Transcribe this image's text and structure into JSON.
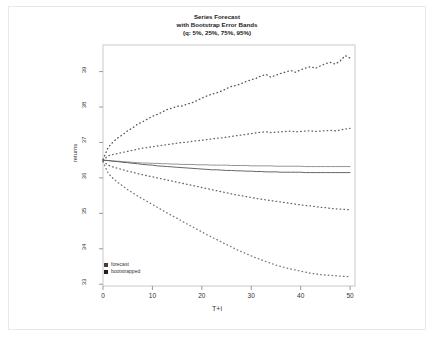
{
  "title": {
    "line1": "Series Forecast",
    "line2": "with Bootstrap Error Bands",
    "line3": "(q: 5%, 25%, 75%, 95%)"
  },
  "legend": {
    "items": [
      {
        "label": "forecast",
        "color": "#404040"
      },
      {
        "label": "bootstrapped",
        "color": "#202020"
      }
    ]
  },
  "chart_data": {
    "type": "line",
    "title": "Series Forecast with Bootstrap Error Bands (q: 5%, 25%, 75%, 95%)",
    "xlabel": "T+i",
    "ylabel": "returns",
    "xlim": [
      0,
      51
    ],
    "ylim": [
      32.95,
      39.75
    ],
    "xticks": [
      0,
      10,
      20,
      30,
      40,
      50
    ],
    "yticks": [
      33,
      34,
      35,
      36,
      37,
      38,
      39
    ],
    "grid": false,
    "legend_position": "bottom-left",
    "x": [
      0,
      1,
      2,
      3,
      4,
      5,
      6,
      7,
      8,
      9,
      10,
      11,
      12,
      13,
      14,
      15,
      16,
      17,
      18,
      19,
      20,
      21,
      22,
      23,
      24,
      25,
      26,
      27,
      28,
      29,
      30,
      31,
      32,
      33,
      34,
      35,
      36,
      37,
      38,
      39,
      40,
      41,
      42,
      43,
      44,
      45,
      46,
      47,
      48,
      49,
      50
    ],
    "series": [
      {
        "name": "q95",
        "style": "dotted",
        "color": "#555555",
        "values": [
          36.52,
          36.85,
          37.01,
          37.13,
          37.22,
          37.33,
          37.41,
          37.52,
          37.58,
          37.66,
          37.74,
          37.79,
          37.86,
          37.93,
          37.97,
          38.02,
          38.03,
          38.08,
          38.12,
          38.18,
          38.25,
          38.31,
          38.36,
          38.4,
          38.45,
          38.52,
          38.58,
          38.61,
          38.66,
          38.72,
          38.77,
          38.81,
          38.88,
          38.92,
          38.84,
          38.9,
          38.95,
          38.99,
          39.03,
          38.98,
          39.05,
          39.1,
          39.14,
          39.09,
          39.16,
          39.22,
          39.26,
          39.21,
          39.3,
          39.45,
          39.38
        ]
      },
      {
        "name": "q75",
        "style": "dotted",
        "color": "#666666",
        "values": [
          36.5,
          36.62,
          36.66,
          36.69,
          36.72,
          36.75,
          36.78,
          36.81,
          36.84,
          36.86,
          36.88,
          36.9,
          36.92,
          36.94,
          36.96,
          36.98,
          37.0,
          37.01,
          37.03,
          37.05,
          37.06,
          37.08,
          37.1,
          37.12,
          37.13,
          37.15,
          37.17,
          37.19,
          37.21,
          37.23,
          37.25,
          37.27,
          37.29,
          37.3,
          37.28,
          37.29,
          37.3,
          37.31,
          37.32,
          37.3,
          37.31,
          37.32,
          37.33,
          37.31,
          37.32,
          37.33,
          37.34,
          37.33,
          37.35,
          37.38,
          37.4
        ]
      },
      {
        "name": "forecast",
        "style": "solid",
        "color": "#888888",
        "values": [
          36.5,
          36.49,
          36.48,
          36.47,
          36.46,
          36.45,
          36.44,
          36.43,
          36.42,
          36.42,
          36.41,
          36.41,
          36.4,
          36.4,
          36.39,
          36.39,
          36.38,
          36.38,
          36.38,
          36.37,
          36.37,
          36.37,
          36.36,
          36.36,
          36.36,
          36.36,
          36.35,
          36.35,
          36.35,
          36.35,
          36.34,
          36.34,
          36.34,
          36.34,
          36.34,
          36.33,
          36.33,
          36.33,
          36.33,
          36.33,
          36.33,
          36.32,
          36.32,
          36.32,
          36.32,
          36.32,
          36.32,
          36.32,
          36.32,
          36.32,
          36.32
        ]
      },
      {
        "name": "bootstrapped",
        "style": "solid",
        "color": "#555555",
        "values": [
          36.5,
          36.49,
          36.47,
          36.46,
          36.44,
          36.43,
          36.41,
          36.4,
          36.38,
          36.37,
          36.36,
          36.34,
          36.33,
          36.32,
          36.31,
          36.3,
          36.29,
          36.28,
          36.27,
          36.26,
          36.25,
          36.24,
          36.23,
          36.23,
          36.22,
          36.21,
          36.21,
          36.2,
          36.2,
          36.19,
          36.19,
          36.18,
          36.18,
          36.17,
          36.17,
          36.17,
          36.16,
          36.16,
          36.16,
          36.16,
          36.16,
          36.15,
          36.15,
          36.15,
          36.15,
          36.15,
          36.15,
          36.15,
          36.15,
          36.15,
          36.15
        ]
      },
      {
        "name": "q25",
        "style": "dotted",
        "color": "#666666",
        "values": [
          36.48,
          36.36,
          36.31,
          36.27,
          36.23,
          36.19,
          36.16,
          36.12,
          36.09,
          36.06,
          36.03,
          36.0,
          35.97,
          35.94,
          35.91,
          35.88,
          35.85,
          35.82,
          35.79,
          35.76,
          35.73,
          35.7,
          35.67,
          35.64,
          35.61,
          35.58,
          35.55,
          35.52,
          35.5,
          35.47,
          35.45,
          35.42,
          35.4,
          35.38,
          35.36,
          35.34,
          35.32,
          35.3,
          35.28,
          35.26,
          35.24,
          35.22,
          35.21,
          35.19,
          35.17,
          35.16,
          35.14,
          35.13,
          35.12,
          35.11,
          35.1
        ]
      },
      {
        "name": "q05",
        "style": "dotted",
        "color": "#777777",
        "values": [
          36.46,
          36.14,
          35.99,
          35.87,
          35.77,
          35.67,
          35.58,
          35.49,
          35.41,
          35.33,
          35.25,
          35.17,
          35.09,
          35.01,
          34.93,
          34.86,
          34.78,
          34.7,
          34.63,
          34.55,
          34.48,
          34.4,
          34.33,
          34.26,
          34.19,
          34.12,
          34.05,
          33.98,
          33.92,
          33.86,
          33.8,
          33.74,
          33.69,
          33.64,
          33.59,
          33.54,
          33.5,
          33.46,
          33.43,
          33.4,
          33.37,
          33.34,
          33.31,
          33.29,
          33.27,
          33.26,
          33.25,
          33.24,
          33.23,
          33.22,
          33.21
        ]
      }
    ]
  }
}
